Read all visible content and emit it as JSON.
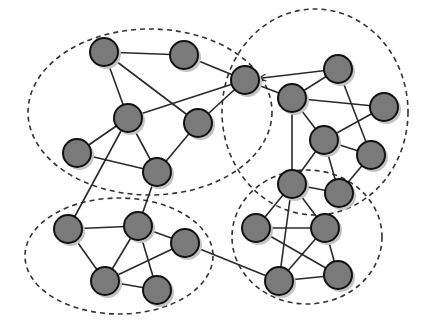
{
  "diagram": {
    "type": "community-network-graph",
    "background": "#ffffff",
    "colors": {
      "node_fill": "#7a7a7a",
      "node_stroke": "#111111",
      "node_shadow": "#c4c4c4",
      "edge": "#2a2a2a",
      "community_boundary": "#333333"
    },
    "node_radius": 14,
    "communities": [
      {
        "id": "top-left",
        "cx": 150,
        "cy": 112,
        "rx": 122,
        "ry": 83
      },
      {
        "id": "top-right",
        "cx": 315,
        "cy": 112,
        "rx": 93,
        "ry": 103
      },
      {
        "id": "bottom-left",
        "cx": 119,
        "cy": 256,
        "rx": 94,
        "ry": 58
      },
      {
        "id": "bottom-right",
        "cx": 307,
        "cy": 237,
        "rx": 75,
        "ry": 67
      }
    ],
    "nodes": [
      {
        "id": "A",
        "x": 104,
        "y": 52
      },
      {
        "id": "B",
        "x": 184,
        "y": 55
      },
      {
        "id": "C",
        "x": 128,
        "y": 118
      },
      {
        "id": "D",
        "x": 198,
        "y": 123
      },
      {
        "id": "E",
        "x": 77,
        "y": 153
      },
      {
        "id": "F",
        "x": 157,
        "y": 172
      },
      {
        "id": "G",
        "x": 245,
        "y": 80
      },
      {
        "id": "H",
        "x": 292,
        "y": 98
      },
      {
        "id": "I",
        "x": 338,
        "y": 69
      },
      {
        "id": "J",
        "x": 384,
        "y": 107
      },
      {
        "id": "K",
        "x": 324,
        "y": 140
      },
      {
        "id": "L",
        "x": 371,
        "y": 155
      },
      {
        "id": "M",
        "x": 292,
        "y": 184
      },
      {
        "id": "N",
        "x": 339,
        "y": 193
      },
      {
        "id": "O",
        "x": 256,
        "y": 228
      },
      {
        "id": "P",
        "x": 325,
        "y": 228
      },
      {
        "id": "Q",
        "x": 279,
        "y": 281
      },
      {
        "id": "R",
        "x": 338,
        "y": 275
      },
      {
        "id": "S",
        "x": 68,
        "y": 229
      },
      {
        "id": "T",
        "x": 138,
        "y": 226
      },
      {
        "id": "U",
        "x": 185,
        "y": 243
      },
      {
        "id": "V",
        "x": 105,
        "y": 281
      },
      {
        "id": "W",
        "x": 157,
        "y": 290
      }
    ],
    "edges": [
      [
        "A",
        "B"
      ],
      [
        "A",
        "C"
      ],
      [
        "A",
        "D"
      ],
      [
        "B",
        "G"
      ],
      [
        "C",
        "G"
      ],
      [
        "D",
        "G"
      ],
      [
        "C",
        "E"
      ],
      [
        "C",
        "F"
      ],
      [
        "C",
        "S"
      ],
      [
        "E",
        "F"
      ],
      [
        "D",
        "F"
      ],
      [
        "F",
        "T"
      ],
      [
        "I",
        "G",
        "arrow"
      ],
      [
        "G",
        "H"
      ],
      [
        "H",
        "I"
      ],
      [
        "H",
        "J"
      ],
      [
        "H",
        "K"
      ],
      [
        "H",
        "M"
      ],
      [
        "I",
        "L"
      ],
      [
        "K",
        "J"
      ],
      [
        "K",
        "L"
      ],
      [
        "K",
        "M"
      ],
      [
        "K",
        "N"
      ],
      [
        "L",
        "N"
      ],
      [
        "M",
        "N"
      ],
      [
        "M",
        "O"
      ],
      [
        "M",
        "P"
      ],
      [
        "M",
        "Q"
      ],
      [
        "O",
        "P"
      ],
      [
        "O",
        "R"
      ],
      [
        "P",
        "Q"
      ],
      [
        "P",
        "R"
      ],
      [
        "Q",
        "R"
      ],
      [
        "U",
        "Q"
      ],
      [
        "S",
        "T"
      ],
      [
        "S",
        "V"
      ],
      [
        "T",
        "U"
      ],
      [
        "T",
        "V"
      ],
      [
        "T",
        "W"
      ],
      [
        "U",
        "V"
      ],
      [
        "V",
        "W"
      ]
    ]
  }
}
